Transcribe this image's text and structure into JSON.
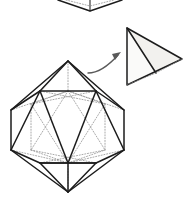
{
  "figure": {
    "description": "A line-art geometric figure showing an icosahedron at lower left with dotted hidden edges, a curved arrow pointing up-right, and an extracted triangular pyramid (tetrahedron) face at upper right. A partial polyhedron is cropped at the top edge.",
    "background_color": "#ffffff",
    "stroke_color": "#1c1c1c",
    "hidden_edge_color": "#8d8d8d",
    "arrow_color": "#5a5a5a",
    "shade_color": "#f0efec"
  },
  "shapes": {
    "cropped_solid": {
      "name": "cropped-polyhedron-top",
      "label": "partial polyhedron cropped at top edge",
      "apex": [
        90,
        11
      ],
      "left": [
        58,
        0
      ],
      "right": [
        122,
        0
      ],
      "stem_top": [
        90,
        0
      ],
      "stem_bottom": [
        90,
        11
      ]
    },
    "icosahedron": {
      "name": "icosahedron",
      "label": "icosahedron",
      "top_vertex": [
        68,
        61
      ],
      "bottom_vertex": [
        68,
        192
      ],
      "left_extent": 11,
      "right_extent": 124,
      "upper_ring_y": [
        91,
        110
      ],
      "lower_ring_y": [
        150,
        165
      ],
      "vertex_count": 12,
      "edge_count": 30,
      "face_count": 20
    },
    "tetrahedron": {
      "name": "extracted-tetrahedron",
      "label": "extracted triangular pyramid",
      "apex": [
        127,
        28
      ],
      "bottom_left": [
        127,
        85
      ],
      "right": [
        182,
        59
      ],
      "inner_vertex": [
        156,
        73
      ]
    },
    "arrow": {
      "name": "extraction-arrow",
      "label": "curved extraction arrow",
      "start": [
        88,
        73
      ],
      "end": [
        121,
        52
      ],
      "direction": "up-right",
      "style": "curved"
    }
  }
}
